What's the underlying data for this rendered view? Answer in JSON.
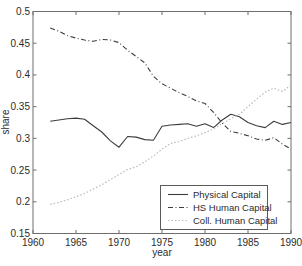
{
  "figure": {
    "background": "#ffffff",
    "axis_box_color": "#6e6e6e",
    "tick_text_color": "#2b2b2b"
  },
  "chart_data": {
    "type": "line",
    "title": "",
    "xlabel": "year",
    "ylabel": "share",
    "xlim": [
      1960,
      1990
    ],
    "ylim": [
      0.15,
      0.5
    ],
    "grid": false,
    "legend_position": "inside-lower-right",
    "xticks": {
      "values": [
        1960,
        1965,
        1970,
        1975,
        1980,
        1985,
        1990
      ],
      "labels": [
        "1960",
        "1965",
        "1970",
        "1975",
        "1980",
        "1985",
        "1990"
      ]
    },
    "yticks": {
      "values": [
        0.15,
        0.2,
        0.25,
        0.3,
        0.35,
        0.4,
        0.45,
        0.5
      ],
      "labels": [
        "0.15",
        "0.2",
        "0.25",
        "0.3",
        "0.35",
        "0.4",
        "0.45",
        "0.5"
      ]
    },
    "x": [
      1962,
      1963,
      1964,
      1965,
      1966,
      1967,
      1968,
      1969,
      1970,
      1971,
      1972,
      1973,
      1974,
      1975,
      1976,
      1977,
      1978,
      1979,
      1980,
      1981,
      1982,
      1983,
      1984,
      1985,
      1986,
      1987,
      1988,
      1989,
      1990
    ],
    "series": [
      {
        "name": "Physical Capital",
        "line_style": "solid",
        "color": "#3d3d3d",
        "values": [
          0.327,
          0.329,
          0.331,
          0.332,
          0.33,
          0.32,
          0.31,
          0.296,
          0.286,
          0.303,
          0.302,
          0.298,
          0.297,
          0.319,
          0.321,
          0.322,
          0.323,
          0.319,
          0.323,
          0.317,
          0.329,
          0.338,
          0.334,
          0.325,
          0.32,
          0.317,
          0.327,
          0.322,
          0.325
        ]
      },
      {
        "name": "HS Human Capital",
        "line_style": "dash-dot",
        "color": "#3d3d3d",
        "values": [
          0.474,
          0.469,
          0.462,
          0.458,
          0.455,
          0.453,
          0.456,
          0.455,
          0.451,
          0.439,
          0.429,
          0.419,
          0.398,
          0.386,
          0.379,
          0.372,
          0.366,
          0.359,
          0.355,
          0.341,
          0.324,
          0.311,
          0.308,
          0.304,
          0.299,
          0.297,
          0.301,
          0.291,
          0.283
        ]
      },
      {
        "name": "Coll. Human Capital",
        "line_style": "dotted",
        "color": "#b9b9b9",
        "values": [
          0.196,
          0.199,
          0.203,
          0.208,
          0.213,
          0.22,
          0.227,
          0.235,
          0.243,
          0.251,
          0.255,
          0.263,
          0.272,
          0.283,
          0.292,
          0.295,
          0.3,
          0.304,
          0.309,
          0.315,
          0.323,
          0.331,
          0.338,
          0.35,
          0.362,
          0.373,
          0.379,
          0.374,
          0.384
        ]
      }
    ]
  }
}
